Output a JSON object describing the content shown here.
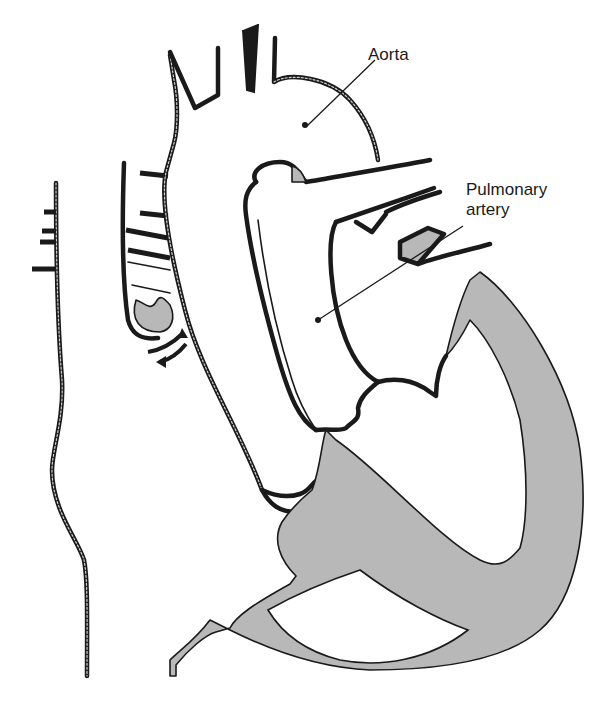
{
  "diagram": {
    "labels": {
      "aorta": "Aorta",
      "pulmonary_artery_line1": "Pulmonary",
      "pulmonary_artery_line2": "artery"
    },
    "colors": {
      "line": "#1a1a1a",
      "muscle_fill": "#b8b8b8",
      "background": "#ffffff"
    }
  }
}
